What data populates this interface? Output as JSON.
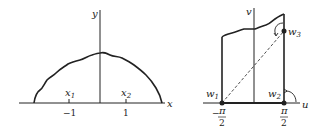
{
  "figure": {
    "left_panel": {
      "axis_labels": {
        "x": "x",
        "y": "y"
      },
      "point_labels": {
        "x1": "x",
        "x1_sub": "1",
        "x2": "x",
        "x2_sub": "2"
      },
      "tick_labels": {
        "neg1": "−1",
        "pos1": "1"
      }
    },
    "right_panel": {
      "axis_labels": {
        "u": "u",
        "v": "v"
      },
      "vertex_labels": {
        "w1": "w",
        "w1_sub": "1",
        "w2": "w",
        "w2_sub": "2",
        "w3": "w",
        "w3_sub": "3"
      },
      "tick_labels": {
        "neg_pi_over_2_sign": "−",
        "pi": "π",
        "two": "2"
      }
    },
    "colors": {
      "ink": "#222222",
      "background": "#ffffff"
    }
  }
}
